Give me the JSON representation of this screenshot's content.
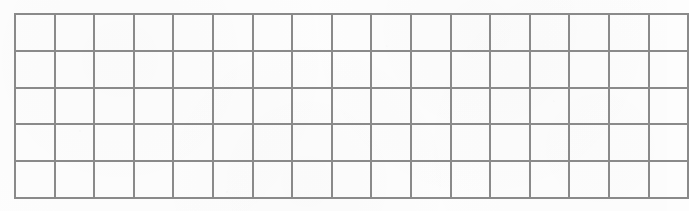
{
  "document": {
    "kind": "blank-grid-table",
    "description": "Empty ruled grid table with no text content",
    "background_color": "#fdfdfd"
  },
  "grid": {
    "columns": 17,
    "rows": 5,
    "line_color": "#8a8a8a",
    "line_width_px": 2,
    "cell_width_px": 37.6,
    "cell_height_px": 36.8,
    "left_px": 14,
    "top_px": 13,
    "width_px": 640,
    "height_px": 184,
    "cells": [
      [
        "",
        "",
        "",
        "",
        "",
        "",
        "",
        "",
        "",
        "",
        "",
        "",
        "",
        "",
        "",
        "",
        ""
      ],
      [
        "",
        "",
        "",
        "",
        "",
        "",
        "",
        "",
        "",
        "",
        "",
        "",
        "",
        "",
        "",
        "",
        ""
      ],
      [
        "",
        "",
        "",
        "",
        "",
        "",
        "",
        "",
        "",
        "",
        "",
        "",
        "",
        "",
        "",
        "",
        ""
      ],
      [
        "",
        "",
        "",
        "",
        "",
        "",
        "",
        "",
        "",
        "",
        "",
        "",
        "",
        "",
        "",
        "",
        ""
      ],
      [
        "",
        "",
        "",
        "",
        "",
        "",
        "",
        "",
        "",
        "",
        "",
        "",
        "",
        "",
        "",
        "",
        ""
      ]
    ]
  }
}
